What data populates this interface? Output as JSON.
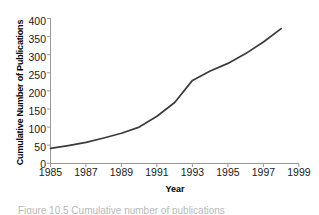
{
  "chart_data": {
    "type": "line",
    "title": "",
    "xlabel": "Year",
    "ylabel": "Cumulative Number of Publications",
    "xlim": [
      1985,
      1999
    ],
    "ylim": [
      0,
      400
    ],
    "grid": false,
    "legend": null,
    "x_ticks": [
      "1985",
      "1987",
      "1989",
      "1991",
      "1993",
      "1995",
      "1997",
      "1999"
    ],
    "y_ticks": [
      "0",
      "50",
      "100",
      "150",
      "200",
      "250",
      "300",
      "350",
      "400"
    ],
    "series": [
      {
        "name": "Cumulative Publications",
        "color": "#3b3b3b",
        "x": [
          1985,
          1986,
          1987,
          1988,
          1989,
          1990,
          1991,
          1992,
          1993,
          1994,
          1995,
          1996,
          1997,
          1998
        ],
        "values": [
          41,
          49,
          58,
          70,
          83,
          100,
          130,
          168,
          229,
          255,
          276,
          303,
          335,
          372
        ]
      }
    ]
  },
  "figure": {
    "y_axis_title": "Cumulative Number of Publications",
    "x_axis_title": "Year",
    "caption_partial": "Figure 10.5  Cumulative number of publications"
  }
}
